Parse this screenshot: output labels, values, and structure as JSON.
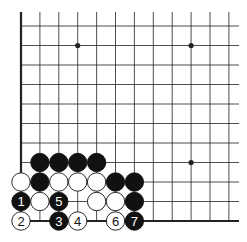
{
  "diagram": {
    "type": "go-board-fragment",
    "grid": {
      "cols": 12,
      "rows": 11,
      "origin_x": 21,
      "origin_y": 26,
      "spacing_x": 18.9,
      "spacing_y": 19.5,
      "top_extent": 12,
      "right_extent": 239,
      "left_edge_thick": true,
      "bottom_edge_thick": true
    },
    "colors": {
      "line": "#222222",
      "black_stone": "#111111",
      "white_stone": "#ffffff",
      "background": "#ffffff"
    },
    "star_points": [
      {
        "col": 3,
        "row": 1
      },
      {
        "col": 9,
        "row": 1
      },
      {
        "col": 9,
        "row": 7
      }
    ],
    "stones": [
      {
        "col": 1,
        "row": 7,
        "color": "black",
        "label": ""
      },
      {
        "col": 2,
        "row": 7,
        "color": "black",
        "label": ""
      },
      {
        "col": 3,
        "row": 7,
        "color": "black",
        "label": ""
      },
      {
        "col": 4,
        "row": 7,
        "color": "black",
        "label": ""
      },
      {
        "col": 0,
        "row": 8,
        "color": "white",
        "label": ""
      },
      {
        "col": 1,
        "row": 8,
        "color": "black",
        "label": ""
      },
      {
        "col": 2,
        "row": 8,
        "color": "white",
        "label": ""
      },
      {
        "col": 3,
        "row": 8,
        "color": "white",
        "label": ""
      },
      {
        "col": 4,
        "row": 8,
        "color": "white",
        "label": ""
      },
      {
        "col": 5,
        "row": 8,
        "color": "black",
        "label": ""
      },
      {
        "col": 6,
        "row": 8,
        "color": "black",
        "label": ""
      },
      {
        "col": 0,
        "row": 9,
        "color": "black",
        "label": "1"
      },
      {
        "col": 1,
        "row": 9,
        "color": "white",
        "label": ""
      },
      {
        "col": 2,
        "row": 9,
        "color": "black",
        "label": "5"
      },
      {
        "col": 4,
        "row": 9,
        "color": "white",
        "label": ""
      },
      {
        "col": 5,
        "row": 9,
        "color": "white",
        "label": ""
      },
      {
        "col": 6,
        "row": 9,
        "color": "black",
        "label": ""
      },
      {
        "col": 0,
        "row": 10,
        "color": "white",
        "label": "2"
      },
      {
        "col": 2,
        "row": 10,
        "color": "black",
        "label": "3"
      },
      {
        "col": 3,
        "row": 10,
        "color": "white",
        "label": "4"
      },
      {
        "col": 5,
        "row": 10,
        "color": "white",
        "label": "6"
      },
      {
        "col": 6,
        "row": 10,
        "color": "black",
        "label": "7"
      }
    ]
  }
}
